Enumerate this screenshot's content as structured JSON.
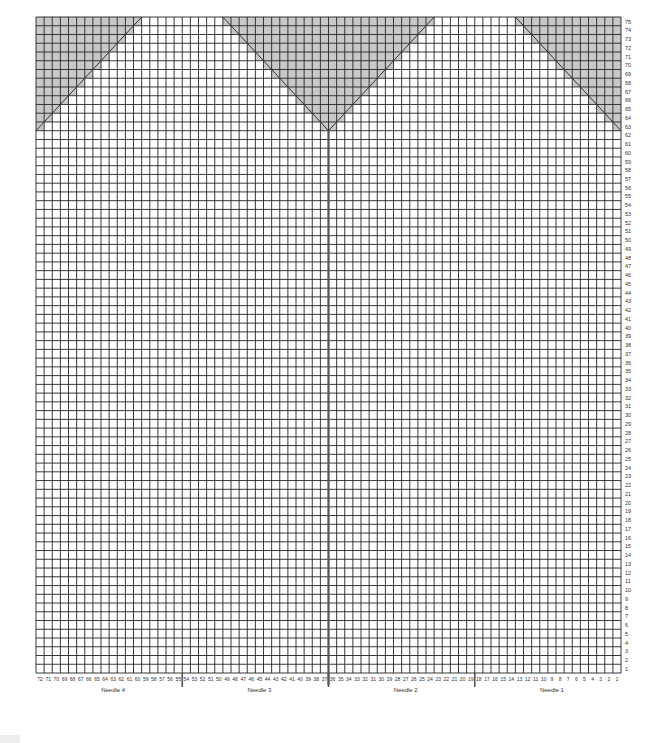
{
  "chart_data": {
    "type": "knitting-chart",
    "title": "",
    "columns": 72,
    "rows": 75,
    "column_numbering": "right-to-left, 1 at right edge, 72 at left edge",
    "row_numbering": "bottom-to-top, 1 at bottom, 75 at top",
    "row_labels_side": "right",
    "needles": [
      {
        "label": "Needle 1",
        "stitches_from": 1,
        "stitches_to": 18
      },
      {
        "label": "Needle 2",
        "stitches_from": 19,
        "stitches_to": 36
      },
      {
        "label": "Needle 3",
        "stitches_from": 37,
        "stitches_to": 54
      },
      {
        "label": "Needle 4",
        "stitches_from": 55,
        "stitches_to": 72
      }
    ],
    "needle_dividers_after_stitch": [
      18,
      36,
      54
    ],
    "main_divider_after_stitch": 36,
    "shaded_regions": [
      {
        "name": "left-triangle",
        "description": "Decrease wedge at left edge, rows 63-75",
        "color": "#cccccc"
      },
      {
        "name": "center-v",
        "description": "Inverted triangle centered on stitch 36/37, rows 63-75",
        "color": "#cccccc"
      },
      {
        "name": "right-triangle",
        "description": "Decrease wedge at right edge, rows 63-75",
        "color": "#cccccc"
      }
    ],
    "shading_start_row": 63,
    "shading_end_row": 75
  },
  "labels": {
    "needle_1": "Needle 1",
    "needle_2": "Needle 2",
    "needle_3": "Needle 3",
    "needle_4": "Needle 4"
  },
  "colors": {
    "grid_line": "#222222",
    "shade": "#c8c8c8",
    "background": "#ffffff"
  }
}
